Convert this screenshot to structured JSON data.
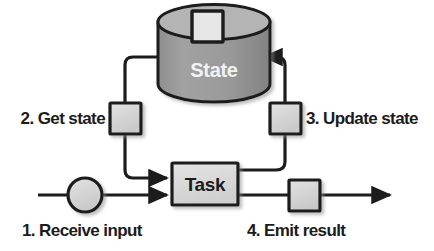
{
  "diagram": {
    "type": "flow-diagram",
    "nodes": {
      "state_store": {
        "label": "State",
        "shape": "cylinder",
        "body_color": "#9a9a9a",
        "top_color": "#b8b8b8",
        "label_color": "#f2f2f2",
        "badge": {
          "shape": "square",
          "fill": "#e0e0e0",
          "stroke": "#1c1c1c"
        }
      },
      "task": {
        "label": "Task",
        "shape": "rectangle",
        "fill": "#dcdcdc",
        "stroke": "#1c1c1c",
        "label_color": "#1c1c1c"
      },
      "input_node": {
        "shape": "circle",
        "fill": "#d8d8d8",
        "stroke": "#1c1c1c"
      },
      "get_state_node": {
        "shape": "square",
        "fill": "#d8d8d8",
        "stroke": "#1c1c1c"
      },
      "update_state_node": {
        "shape": "square",
        "fill": "#d8d8d8",
        "stroke": "#1c1c1c"
      },
      "emit_result_node": {
        "shape": "square",
        "fill": "#d8d8d8",
        "stroke": "#1c1c1c"
      }
    },
    "steps": [
      {
        "number": "1.",
        "text": "Receive input",
        "full": "1. Receive input"
      },
      {
        "number": "2.",
        "text": "Get state",
        "full": "2. Get state"
      },
      {
        "number": "3.",
        "text": "Update state",
        "full": "3. Update state"
      },
      {
        "number": "4.",
        "text": "Emit result",
        "full": "4. Emit result"
      }
    ],
    "edges": [
      {
        "from": "input_node",
        "to": "task",
        "arrow": true
      },
      {
        "from": "state_store",
        "to": "get_state_node",
        "arrow": false
      },
      {
        "from": "get_state_node",
        "to": "task",
        "arrow": true
      },
      {
        "from": "task",
        "to": "update_state_node",
        "arrow": false
      },
      {
        "from": "update_state_node",
        "to": "state_store",
        "arrow": true
      },
      {
        "from": "task",
        "to": "emit_result_node",
        "arrow": false
      },
      {
        "from": "emit_result_node",
        "to": "output",
        "arrow": true
      }
    ],
    "colors": {
      "line": "#1c1c1c",
      "text": "#1c1c1c",
      "background": "#ffffff"
    }
  }
}
